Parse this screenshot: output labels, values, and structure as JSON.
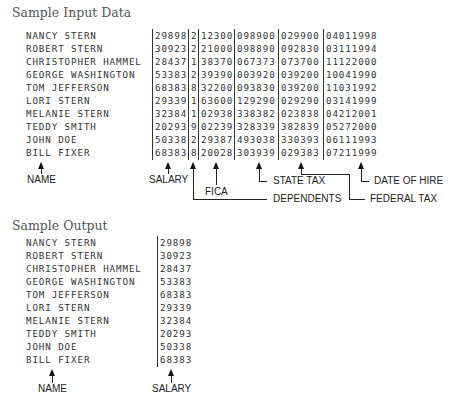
{
  "input_section": {
    "title": "Sample Input Data",
    "columns": [
      "NAME",
      "SALARY",
      "DEPENDENTS",
      "FICA",
      "STATE TAX",
      "FEDERAL TAX",
      "DATE OF HIRE"
    ],
    "rows": [
      {
        "name": "NANCY STERN",
        "salary": "29898",
        "dependents": "2",
        "fica": "12300",
        "state_tax": "098900",
        "federal_tax": "029900",
        "date_of_hire": "04011998"
      },
      {
        "name": "ROBERT STERN",
        "salary": "30923",
        "dependents": "2",
        "fica": "21000",
        "state_tax": "098890",
        "federal_tax": "092830",
        "date_of_hire": "03111994"
      },
      {
        "name": "CHRISTOPHER HAMMEL",
        "salary": "28437",
        "dependents": "1",
        "fica": "38370",
        "state_tax": "067373",
        "federal_tax": "073700",
        "date_of_hire": "11122000"
      },
      {
        "name": "GEORGE WASHINGTON",
        "salary": "53383",
        "dependents": "2",
        "fica": "39390",
        "state_tax": "003920",
        "federal_tax": "039200",
        "date_of_hire": "10041990"
      },
      {
        "name": "TOM JEFFERSON",
        "salary": "68383",
        "dependents": "8",
        "fica": "32200",
        "state_tax": "093830",
        "federal_tax": "039200",
        "date_of_hire": "11031992"
      },
      {
        "name": "LORI STERN",
        "salary": "29339",
        "dependents": "1",
        "fica": "63600",
        "state_tax": "129290",
        "federal_tax": "029290",
        "date_of_hire": "03141999"
      },
      {
        "name": "MELANIE STERN",
        "salary": "32384",
        "dependents": "1",
        "fica": "02938",
        "state_tax": "338382",
        "federal_tax": "023838",
        "date_of_hire": "04212001"
      },
      {
        "name": "TEDDY SMITH",
        "salary": "20293",
        "dependents": "9",
        "fica": "02239",
        "state_tax": "328339",
        "federal_tax": "382839",
        "date_of_hire": "05272000"
      },
      {
        "name": "JOHN DOE",
        "salary": "50338",
        "dependents": "2",
        "fica": "29387",
        "state_tax": "493038",
        "federal_tax": "330393",
        "date_of_hire": "06111993"
      },
      {
        "name": "BILL FIXER",
        "salary": "68383",
        "dependents": "8",
        "fica": "20028",
        "state_tax": "303939",
        "federal_tax": "029383",
        "date_of_hire": "07211999"
      }
    ],
    "labels": {
      "name": "NAME",
      "salary": "SALARY",
      "fica": "FICA",
      "state_tax": "STATE TAX",
      "date_of_hire": "DATE OF HIRE",
      "dependents": "DEPENDENTS",
      "federal_tax": "FEDERAL TAX"
    }
  },
  "output_section": {
    "title": "Sample Output",
    "rows": [
      {
        "name": "NANCY STERN",
        "salary": "29898"
      },
      {
        "name": "ROBERT STERN",
        "salary": "30923"
      },
      {
        "name": "CHRISTOPHER HAMMEL",
        "salary": "28437"
      },
      {
        "name": "GEORGE WASHINGTON",
        "salary": "53383"
      },
      {
        "name": "TOM JEFFERSON",
        "salary": "68383"
      },
      {
        "name": "LORI STERN",
        "salary": "29339"
      },
      {
        "name": "MELANIE STERN",
        "salary": "32384"
      },
      {
        "name": "TEDDY SMITH",
        "salary": "20293"
      },
      {
        "name": "JOHN DOE",
        "salary": "50338"
      },
      {
        "name": "BILL FIXER",
        "salary": "68383"
      }
    ],
    "labels": {
      "name": "NAME",
      "salary": "SALARY"
    }
  }
}
